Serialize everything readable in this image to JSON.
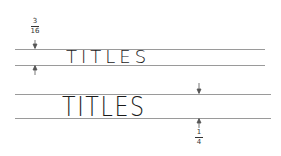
{
  "diagram": {
    "rows": [
      {
        "text": "TITLES",
        "line_spacing_label": {
          "numerator": "3",
          "denominator": "16"
        }
      },
      {
        "text": "TITLES",
        "line_spacing_label": {
          "numerator": "1",
          "denominator": "4"
        }
      }
    ],
    "colors": {
      "guide_line": "#9a9a9a",
      "text": "#1a1a1a",
      "arrow": "#555555"
    }
  }
}
